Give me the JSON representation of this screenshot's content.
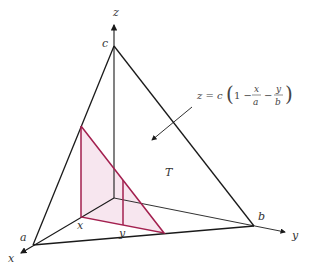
{
  "figure": {
    "colors": {
      "edge": "#1a1a1a",
      "slice_stroke": "#a3204f",
      "slice_fill": "#f7e6ef",
      "label": "#333333"
    },
    "labels": {
      "z_axis": "z",
      "x_axis": "x",
      "y_axis": "y",
      "vertex_c": "c",
      "vertex_a": "a",
      "vertex_b": "b",
      "point_x": "x",
      "point_y": "y",
      "region": "T"
    },
    "formula": {
      "lhs": "z = c",
      "open": "(",
      "one_minus": "1 −",
      "frac1_num": "x",
      "frac1_den": "a",
      "minus": "−",
      "frac2_num": "y",
      "frac2_den": "b",
      "close": ")"
    }
  }
}
